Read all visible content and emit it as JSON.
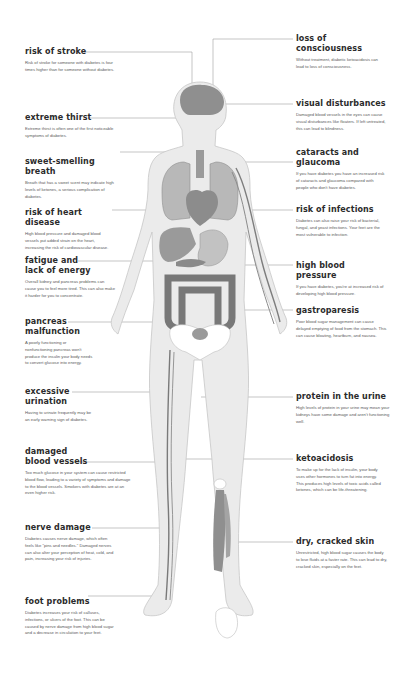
{
  "diagram": {
    "colors": {
      "skin": "#ececec",
      "skin_outline": "#c9c9c9",
      "organ": "#8d8d8d",
      "organ_light": "#b5b5b5",
      "bone": "#ffffff",
      "vessel": "#7a7a7a",
      "leader_line": "#9a9a9a",
      "title_text": "#2b2b2b",
      "body_text": "#5a5a5a"
    }
  },
  "left_callouts": [
    {
      "title": "risk of stroke",
      "text": "Risk of stroke for someone with diabetes is four times higher than for someone without diabetes."
    },
    {
      "title": "extreme thirst",
      "text": "Extreme thirst is often one of the first noticeable symptoms of diabetes."
    },
    {
      "title": "sweet-smelling breath",
      "text": "Breath that has a sweet scent may indicate high levels of ketones, a serious complication of diabetes."
    },
    {
      "title": "risk of heart disease",
      "text": "High blood pressure and damaged blood vessels put added strain on the heart, increasing the risk of cardiovascular disease."
    },
    {
      "title": "fatigue and\nlack of energy",
      "text": "Overall kidney and pancreas problems can cause you to feel more tired. This can also make it harder for you to concentrate."
    },
    {
      "title": "pancreas\nmalfunction",
      "text": "A poorly functioning or nonfunctioning pancreas won't produce the insulin your body needs to convert glucose into energy."
    },
    {
      "title": "excessive\nurination",
      "text": "Having to urinate frequently may be an early warning sign of diabetes."
    },
    {
      "title": "damaged\nblood vessels",
      "text": "Too much glucose in your system can cause restricted blood flow, leading to a variety of symptoms and damage to the blood vessels. Smokers with diabetes are at an even higher risk."
    },
    {
      "title": "nerve damage",
      "text": "Diabetes causes nerve damage, which often feels like \"pins and needles.\" Damaged nerves can also alter your perception of heat, cold, and pain, increasing your risk of injuries."
    },
    {
      "title": "foot problems",
      "text": "Diabetes increases your risk of calluses, infections, or ulcers of the foot. This can be caused by nerve damage from high blood sugar and a decrease in circulation to your feet."
    }
  ],
  "right_callouts": [
    {
      "title": "loss of\nconsciousness",
      "text": "Without treatment, diabetic ketoacidosis can lead to loss of consciousness."
    },
    {
      "title": "visual disturbances",
      "text": "Damaged blood vessels in the eyes can cause visual disturbances like floaters. If left untreated, this can lead to blindness."
    },
    {
      "title": "cataracts and\nglaucoma",
      "text": "If you have diabetes you have an increased risk of cataracts and glaucoma compared with people who don't have diabetes."
    },
    {
      "title": "risk of infections",
      "text": "Diabetes can also raise your risk of bacterial, fungal, and yeast infections. Your feet are the most vulnerable to infection."
    },
    {
      "title": "high blood pressure",
      "text": "If you have diabetes, you're at increased risk of developing high blood pressure."
    },
    {
      "title": "gastroparesis",
      "text": "Poor blood sugar management can cause delayed emptying of food from the stomach. This can cause bloating, heartburn, and nausea."
    },
    {
      "title": "protein in the urine",
      "text": "High levels of protein in your urine may mean your kidneys have some damage and aren't functioning well."
    },
    {
      "title": "ketoacidosis",
      "text": "To make up for the lack of insulin, your body uses other hormones to turn fat into energy. This produces high levels of toxic acids called ketones, which can be life-threatening."
    },
    {
      "title": "dry, cracked skin",
      "text": "Unrestricted, high blood sugar causes the body to lose fluids at a faster rate. This can lead to dry, cracked skin, especially on the feet."
    }
  ]
}
